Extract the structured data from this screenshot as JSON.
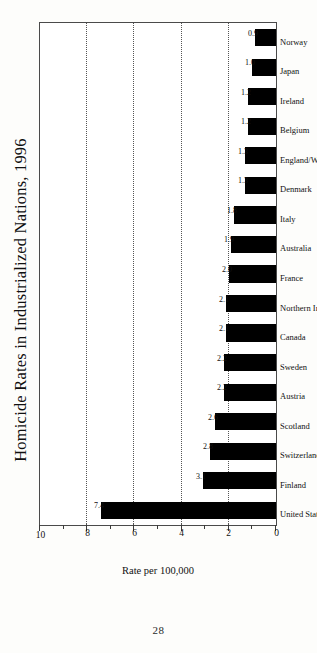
{
  "page": {
    "folio": "28"
  },
  "chart_data": {
    "type": "bar",
    "title": "Homicide Rates in Industrialized Nations, 1996",
    "xlabel": "",
    "ylabel": "Rate per 100,000",
    "ylim": [
      0,
      10
    ],
    "grid": "dotted horizontal gridlines at 2, 4, 6, 8",
    "legend": "none",
    "orientation": "vertical bars; figure rotated 90 degrees on the printed page",
    "major_ticks": [
      0,
      2,
      4,
      6,
      8,
      10
    ],
    "minor_ticks": [
      1,
      3,
      5,
      7,
      9
    ],
    "gridlines": [
      2,
      4,
      6,
      8
    ],
    "categories": [
      "United States",
      "Finland",
      "Switzerland",
      "Scotland",
      "Austria",
      "Sweden",
      "Canada",
      "Northern Ireland",
      "France",
      "Australia",
      "Italy",
      "Denmark",
      "England/Wales",
      "Belgium",
      "Ireland",
      "Japan",
      "Norway"
    ],
    "values": [
      7.4,
      3.1,
      2.8,
      2.6,
      2.2,
      2.2,
      2.1,
      2.1,
      2.0,
      1.9,
      1.8,
      1.3,
      1.3,
      1.2,
      1.2,
      1.0,
      0.9
    ],
    "value_labels": [
      "7.4",
      "3.1",
      "2.8",
      "2.6",
      "2.2",
      "2.2",
      "2.1",
      "2.1",
      "2.0",
      "1.9",
      "1.8",
      "1.3",
      "1.3",
      "1.2",
      "1.2",
      "1.0",
      "0.9"
    ],
    "tick_labels": [
      "0",
      "2",
      "4",
      "6",
      "8",
      "10"
    ],
    "colors": {
      "bar": "#000000",
      "frame": "#4a4a4a",
      "grid": "#555555",
      "text": "#111111",
      "background": "#ffffff"
    }
  }
}
